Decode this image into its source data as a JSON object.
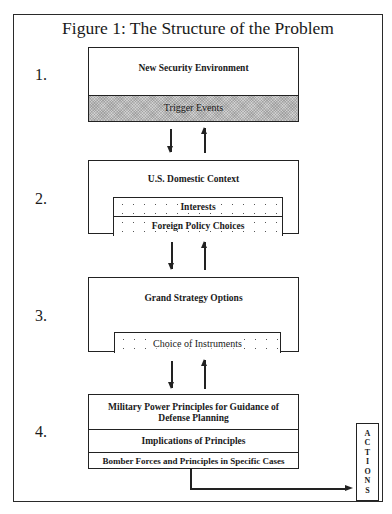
{
  "title": "Figure 1:  The Structure of the Problem",
  "levels": [
    {
      "number": "1.",
      "heading": "New Security Environment",
      "sub": "Trigger Events"
    },
    {
      "number": "2.",
      "heading": "U.S. Domestic Context",
      "subs": [
        "Interests",
        "Foreign Policy Choices"
      ]
    },
    {
      "number": "3.",
      "heading": "Grand Strategy Options",
      "sub": "Choice of Instruments"
    },
    {
      "number": "4.",
      "heading": "Military Power Principles for Guidance of Defense Planning",
      "rows": [
        "Implications of Principles",
        "Bomber Forces and Principles in Specific Cases"
      ]
    }
  ],
  "actions_letters": [
    "A",
    "C",
    "T",
    "I",
    "O",
    "N",
    "S"
  ]
}
